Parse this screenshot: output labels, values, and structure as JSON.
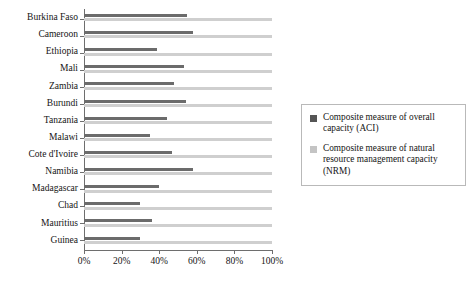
{
  "chart_data": {
    "type": "bar",
    "orientation": "horizontal",
    "title": "",
    "xlabel": "",
    "ylabel": "",
    "xlim": [
      0,
      100
    ],
    "grid": false,
    "legend_position": "right",
    "xtick_labels": [
      "0%",
      "20%",
      "40%",
      "60%",
      "80%",
      "100%"
    ],
    "xtick_values": [
      0,
      20,
      40,
      60,
      80,
      100
    ],
    "categories": [
      "Burkina Faso",
      "Cameroon",
      "Ethiopia",
      "Mali",
      "Zambia",
      "Burundi",
      "Tanzania",
      "Malawi",
      "Cote d'Ivoire",
      "Namibia",
      "Madagascar",
      "Chad",
      "Mauritius",
      "Guinea"
    ],
    "series": [
      {
        "name": "Composite measure of overall capacity (ACI)",
        "color": "#6b6b6b",
        "values": [
          55,
          58,
          39,
          53,
          48,
          54,
          44,
          35,
          47,
          58,
          40,
          30,
          36,
          30
        ]
      },
      {
        "name": "Composite measure of natural resource management capacity (NRM)",
        "color": "#cfcfcf",
        "values": [
          100,
          100,
          100,
          100,
          100,
          100,
          100,
          100,
          100,
          100,
          100,
          100,
          100,
          100
        ]
      }
    ]
  },
  "legend": {
    "items": [
      {
        "swatch": "dark-gray-swatch",
        "label": "Composite measure of overall capacity (ACI)"
      },
      {
        "swatch": "light-gray-swatch",
        "label": "Composite measure of natural resource management capacity (NRM)"
      }
    ]
  }
}
